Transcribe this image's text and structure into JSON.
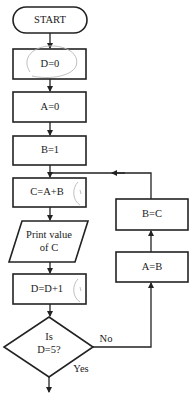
{
  "diagram": {
    "type": "flowchart",
    "nodes": {
      "start": {
        "label": "START",
        "shape": "terminal"
      },
      "d0": {
        "label": "D=0",
        "shape": "process"
      },
      "a0": {
        "label": "A=0",
        "shape": "process"
      },
      "b1": {
        "label": "B=1",
        "shape": "process"
      },
      "cab": {
        "label": "C=A+B",
        "shape": "process"
      },
      "print": {
        "line1": "Print value",
        "line2": "of C",
        "shape": "input-output"
      },
      "dinc": {
        "label": "D=D+1",
        "shape": "process"
      },
      "decision": {
        "line1": "Is",
        "line2": "D=5?",
        "shape": "decision"
      },
      "ab": {
        "label": "A=B",
        "shape": "process"
      },
      "bc": {
        "label": "B=C",
        "shape": "process"
      }
    },
    "edge_labels": {
      "no": "No",
      "yes": "Yes"
    },
    "edges": [
      [
        "start",
        "d0"
      ],
      [
        "d0",
        "a0"
      ],
      [
        "a0",
        "b1"
      ],
      [
        "b1",
        "cab"
      ],
      [
        "cab",
        "print"
      ],
      [
        "print",
        "dinc"
      ],
      [
        "dinc",
        "decision"
      ],
      [
        "decision",
        "ab",
        "No"
      ],
      [
        "ab",
        "bc"
      ],
      [
        "bc",
        "cab"
      ],
      [
        "decision",
        "end",
        "Yes"
      ]
    ]
  }
}
